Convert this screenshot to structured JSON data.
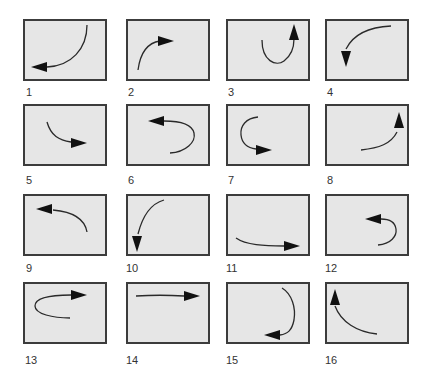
{
  "colors": {
    "panel_fill": "#e6e6e6",
    "panel_border": "#3c3c3c",
    "arrow": "#111111",
    "label": "#333333"
  },
  "panels": [
    {
      "label": "1",
      "description": "clockwise arc from top-right down to bottom-left, arrow pointing left"
    },
    {
      "label": "2",
      "description": "arc from bottom-left curving up, arrow pointing right"
    },
    {
      "label": "3",
      "description": "U-turn curve, arrow pointing up"
    },
    {
      "label": "4",
      "description": "arc from top-right curving left and down, arrow pointing down"
    },
    {
      "label": "5",
      "description": "arc curving down then right, arrow pointing right"
    },
    {
      "label": "6",
      "description": "U-turn bulging right, arrow pointing left"
    },
    {
      "label": "7",
      "description": "U-turn bulging left, arrow pointing right"
    },
    {
      "label": "8",
      "description": "arc curving right then up, arrow pointing up"
    },
    {
      "label": "9",
      "description": "arc curving up then left, arrow pointing left"
    },
    {
      "label": "10",
      "description": "arc from top curving down-left, arrow pointing down"
    },
    {
      "label": "11",
      "description": "shallow arc left to right, arrow pointing right"
    },
    {
      "label": "12",
      "description": "U-turn bulging right, arrow pointing left"
    },
    {
      "label": "13",
      "description": "U-turn bulging left, arrow pointing right"
    },
    {
      "label": "14",
      "description": "straight line left to right, arrow pointing right"
    },
    {
      "label": "15",
      "description": "U-turn bulging right from top to bottom, arrow pointing left"
    },
    {
      "label": "16",
      "description": "arc curving left then up, arrow pointing up"
    }
  ]
}
